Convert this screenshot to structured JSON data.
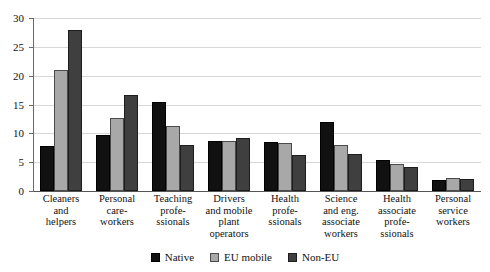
{
  "chart_data": {
    "type": "bar",
    "title": "",
    "subtitle": "",
    "xlabel": "",
    "ylabel": "",
    "ylim": [
      0,
      30
    ],
    "ytick_step": 5,
    "yticks": [
      0,
      5,
      10,
      15,
      20,
      25,
      30
    ],
    "grid": true,
    "legend_position": "bottom",
    "categories": [
      "Cleaners and helpers",
      "Personal care-workers",
      "Teaching profe-ssionals",
      "Drivers and mobile plant operators",
      "Health profe-ssionals",
      "Science and eng. associate workers",
      "Health associate profe-ssionals",
      "Personal service workers"
    ],
    "category_lines": [
      [
        "Cleaners",
        "and",
        "helpers"
      ],
      [
        "Personal",
        "care-",
        "workers"
      ],
      [
        "Teaching",
        "profe-",
        "ssionals"
      ],
      [
        "Drivers",
        "and mobile",
        "plant",
        "operators"
      ],
      [
        "Health",
        "profe-",
        "ssionals"
      ],
      [
        "Science",
        "and eng.",
        "associate",
        "workers"
      ],
      [
        "Health",
        "associate",
        "profe-",
        "ssionals"
      ],
      [
        "Personal",
        "service",
        "workers"
      ]
    ],
    "series": [
      {
        "name": "Native",
        "color": "#111111",
        "values": [
          7.8,
          9.8,
          15.4,
          8.7,
          8.5,
          12.0,
          5.4,
          1.9
        ]
      },
      {
        "name": "EU mobile",
        "color": "#a8a8a8",
        "values": [
          21.0,
          12.6,
          11.3,
          8.7,
          8.3,
          8.0,
          4.7,
          2.3
        ]
      },
      {
        "name": "Non-EU",
        "color": "#3f3f3f",
        "values": [
          27.9,
          16.7,
          8.0,
          9.2,
          6.2,
          6.4,
          4.2,
          2.0
        ]
      }
    ]
  }
}
